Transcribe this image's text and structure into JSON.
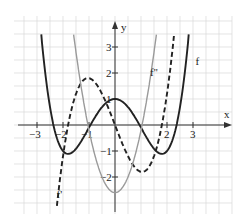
{
  "chart_data": {
    "type": "line",
    "title": "",
    "xlabel": "x",
    "ylabel": "y",
    "xlim": [
      -3.5,
      4.3
    ],
    "ylim": [
      -3.3,
      4.2
    ],
    "grid": true,
    "x_ticks": [
      -3,
      -2,
      -1,
      2,
      3
    ],
    "x_tick_labels": [
      "-3",
      "-2",
      "-1",
      "2",
      "3"
    ],
    "y_ticks": [
      3,
      2,
      1,
      -1,
      -2
    ],
    "y_tick_labels": [
      "3",
      "2",
      "1",
      "-1",
      "-2"
    ],
    "series": [
      {
        "name": "f",
        "style": "solid",
        "color": "#222222",
        "formula": "0.2x^4 - 1.3x^2 + 1",
        "key_points": {
          "max": [
            0,
            1
          ],
          "min_left": [
            -1.8,
            -1.1
          ],
          "min_right": [
            1.8,
            -1.1
          ],
          "zeros": [
            -2.4,
            -0.95,
            0.95,
            2.4
          ]
        }
      },
      {
        "name": "f'",
        "style": "dashed",
        "color": "#222222",
        "formula": "0.8x^3 - 2.6x",
        "key_points": {
          "max": [
            -1.04,
            1.8
          ],
          "min": [
            1.04,
            -1.8
          ],
          "zeros": [
            -1.8,
            0,
            1.8
          ]
        }
      },
      {
        "name": "f''",
        "style": "solid-light",
        "color": "#9a9a9a",
        "formula": "2.4x^2 - 2.6",
        "key_points": {
          "min": [
            0,
            -2.6
          ],
          "zeros": [
            -1.04,
            1.04
          ]
        }
      }
    ],
    "curve_labels": [
      {
        "text": "f",
        "x": 3.1,
        "y": 2.3
      },
      {
        "text": "f'",
        "x": -2.25,
        "y": -2.8
      },
      {
        "text": "f''",
        "x": 1.35,
        "y": 1.9
      }
    ]
  }
}
